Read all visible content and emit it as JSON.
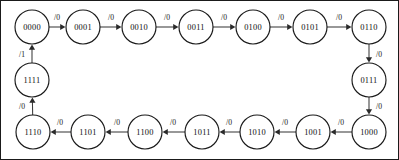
{
  "diagram": {
    "type": "finite-state-machine",
    "node_radius": 17,
    "colors": {
      "background": "#ffffff",
      "node_stroke": "#1a1a1a",
      "node_fill": "#ffffff",
      "edge_stroke": "#3a3a3a",
      "text": "#111111",
      "frame": "#1a1a1a"
    },
    "states": [
      {
        "id": "s0",
        "label": "0000",
        "cx": 32,
        "cy": 27
      },
      {
        "id": "s1",
        "label": "0001",
        "cx": 83,
        "cy": 27
      },
      {
        "id": "s2",
        "label": "0010",
        "cx": 139,
        "cy": 27
      },
      {
        "id": "s3",
        "label": "0011",
        "cx": 196,
        "cy": 27
      },
      {
        "id": "s4",
        "label": "0100",
        "cx": 253,
        "cy": 27
      },
      {
        "id": "s5",
        "label": "0101",
        "cx": 310,
        "cy": 27
      },
      {
        "id": "s6",
        "label": "0110",
        "cx": 369,
        "cy": 27
      },
      {
        "id": "s7",
        "label": "0111",
        "cx": 369,
        "cy": 80
      },
      {
        "id": "s8",
        "label": "1000",
        "cx": 369,
        "cy": 132
      },
      {
        "id": "s9",
        "label": "1001",
        "cx": 313,
        "cy": 132
      },
      {
        "id": "s10",
        "label": "1010",
        "cx": 257,
        "cy": 132
      },
      {
        "id": "s11",
        "label": "1011",
        "cx": 202,
        "cy": 132
      },
      {
        "id": "s12",
        "label": "1100",
        "cx": 145,
        "cy": 132
      },
      {
        "id": "s13",
        "label": "1101",
        "cx": 88,
        "cy": 132
      },
      {
        "id": "s14",
        "label": "1110",
        "cx": 33,
        "cy": 132
      },
      {
        "id": "s15",
        "label": "1111",
        "cx": 32,
        "cy": 80
      }
    ],
    "transitions": [
      {
        "from": "s0",
        "to": "s1",
        "label": "/0",
        "label_x": 57,
        "label_y": 17
      },
      {
        "from": "s1",
        "to": "s2",
        "label": "/0",
        "label_x": 111,
        "label_y": 17
      },
      {
        "from": "s2",
        "to": "s3",
        "label": "/0",
        "label_x": 167,
        "label_y": 17
      },
      {
        "from": "s3",
        "to": "s4",
        "label": "/0",
        "label_x": 224,
        "label_y": 17
      },
      {
        "from": "s4",
        "to": "s5",
        "label": "/0",
        "label_x": 281,
        "label_y": 17
      },
      {
        "from": "s5",
        "to": "s6",
        "label": "/0",
        "label_x": 339,
        "label_y": 17
      },
      {
        "from": "s6",
        "to": "s7",
        "label": "/0",
        "label_x": 379,
        "label_y": 54
      },
      {
        "from": "s7",
        "to": "s8",
        "label": "/0",
        "label_x": 379,
        "label_y": 106
      },
      {
        "from": "s8",
        "to": "s9",
        "label": "/0",
        "label_x": 341,
        "label_y": 122
      },
      {
        "from": "s9",
        "to": "s10",
        "label": "/0",
        "label_x": 285,
        "label_y": 122
      },
      {
        "from": "s10",
        "to": "s11",
        "label": "/0",
        "label_x": 229,
        "label_y": 122
      },
      {
        "from": "s11",
        "to": "s12",
        "label": "/0",
        "label_x": 173,
        "label_y": 122
      },
      {
        "from": "s12",
        "to": "s13",
        "label": "/0",
        "label_x": 117,
        "label_y": 122
      },
      {
        "from": "s13",
        "to": "s14",
        "label": "/0",
        "label_x": 60,
        "label_y": 122
      },
      {
        "from": "s14",
        "to": "s15",
        "label": "/0",
        "label_x": 22,
        "label_y": 106
      },
      {
        "from": "s15",
        "to": "s0",
        "label": "/1",
        "label_x": 22,
        "label_y": 54
      }
    ]
  }
}
